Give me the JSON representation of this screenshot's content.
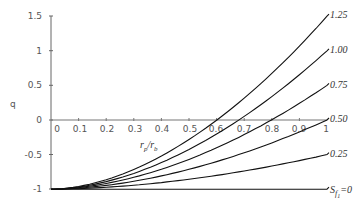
{
  "chart_data": {
    "type": "line",
    "title": "",
    "xlabel": "r_p/r_b",
    "ylabel": "q",
    "xlim": [
      0,
      1
    ],
    "ylim": [
      -1,
      1.5
    ],
    "x_ticks": [
      "0",
      "0.1",
      "0.2",
      "0.3",
      "0.4",
      "0.5",
      "0.6",
      "0.7",
      "0.8",
      "0.9",
      "1"
    ],
    "y_ticks": [
      "1.5",
      "1",
      "0.5",
      "0",
      "-0.5",
      "-1"
    ],
    "grid": false,
    "legend": "inline labels at right end of curves",
    "x": [
      0,
      0.1,
      0.2,
      0.3,
      0.4,
      0.5,
      0.6,
      0.7,
      0.8,
      0.9,
      1.0
    ],
    "series": [
      {
        "name": "1.25",
        "values": [
          -1,
          -0.96,
          -0.85,
          -0.68,
          -0.44,
          -0.14,
          0.02,
          0.32,
          0.67,
          1.08,
          1.53
        ]
      },
      {
        "name": "1.00",
        "values": [
          -1,
          -0.97,
          -0.88,
          -0.74,
          -0.55,
          -0.31,
          -0.2,
          0.05,
          0.34,
          0.66,
          1.02
        ]
      },
      {
        "name": "0.75",
        "values": [
          -1,
          -0.98,
          -0.91,
          -0.81,
          -0.66,
          -0.48,
          -0.4,
          -0.21,
          0.0,
          0.25,
          0.52
        ]
      },
      {
        "name": "0.50",
        "values": [
          -1,
          -0.98,
          -0.94,
          -0.87,
          -0.78,
          -0.66,
          -0.6,
          -0.47,
          -0.33,
          -0.17,
          0.0
        ]
      },
      {
        "name": "0.25",
        "values": [
          -1,
          -0.99,
          -0.97,
          -0.94,
          -0.89,
          -0.83,
          -0.8,
          -0.74,
          -0.66,
          -0.58,
          -0.5
        ]
      },
      {
        "name": "S_f1=0",
        "values": [
          -1,
          -1,
          -1,
          -1,
          -1,
          -1,
          -1,
          -1,
          -1,
          -1,
          -1
        ]
      }
    ]
  },
  "axis": {
    "ylabel": "q",
    "xlabel_main": "r",
    "xlabel_sub1": "p",
    "xlabel_slash": "/r",
    "xlabel_sub2": "b"
  },
  "curve_labels": [
    "1.25",
    "1.00",
    "0.75",
    "0.50",
    "0.25"
  ],
  "baseline_label": {
    "main": "S",
    "sub1": "f",
    "sub2": "1",
    "suffix": "=0"
  }
}
